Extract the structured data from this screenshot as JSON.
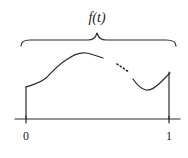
{
  "diagram": {
    "title": "f(t)",
    "axis": {
      "ticks": [
        {
          "label": "0"
        },
        {
          "label": "1"
        }
      ]
    },
    "colors": {
      "ink": "#2a2a2a",
      "background": "#ffffff"
    }
  }
}
